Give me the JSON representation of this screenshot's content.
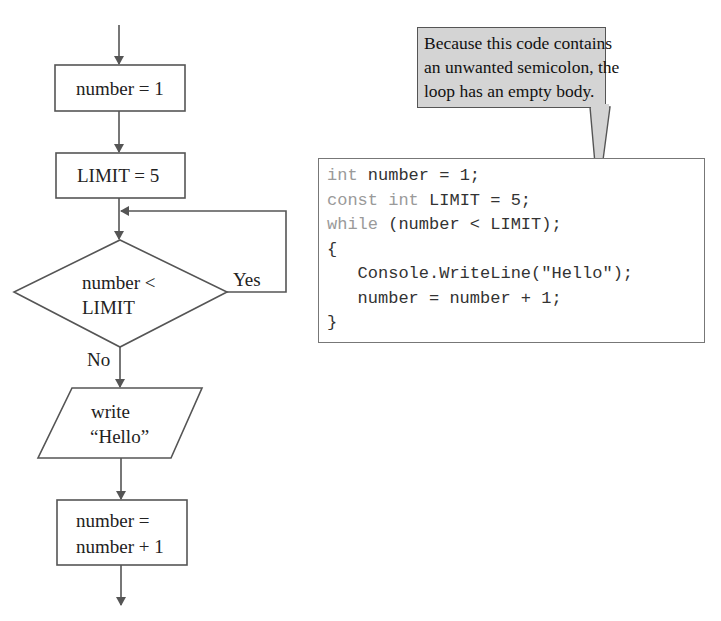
{
  "flowchart": {
    "steps": [
      {
        "shape": "process",
        "text": "number = 1"
      },
      {
        "shape": "process",
        "text": "LIMIT = 5"
      },
      {
        "shape": "decision",
        "lines": [
          "number <",
          "LIMIT"
        ],
        "yes_label": "Yes",
        "no_label": "No"
      },
      {
        "shape": "io",
        "lines": [
          "write",
          "“Hello”"
        ]
      },
      {
        "shape": "process",
        "lines": [
          "number =",
          "number + 1"
        ]
      }
    ],
    "colors": {
      "line": "#555555",
      "arrow": "#555555"
    }
  },
  "callout": {
    "lines": [
      "Because this code contains",
      "an unwanted semicolon, the",
      "loop has an empty body."
    ],
    "fill": "#d4d4d4"
  },
  "code": {
    "lines": [
      {
        "kw": "int",
        "rest": " number = 1;"
      },
      {
        "kw": "const int",
        "rest": " LIMIT = 5;"
      },
      {
        "kw": "while",
        "rest": " (number < LIMIT);"
      },
      {
        "kw": "",
        "rest": "{"
      },
      {
        "kw": "",
        "rest": "   Console.WriteLine(\"Hello\");"
      },
      {
        "kw": "",
        "rest": "   number = number + 1;"
      },
      {
        "kw": "",
        "rest": "}"
      }
    ]
  }
}
